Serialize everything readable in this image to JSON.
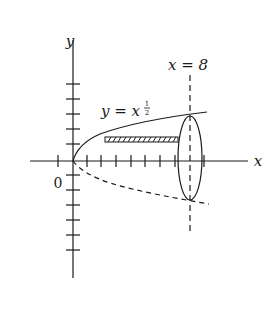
{
  "figure": {
    "type": "solid-of-revolution diagram",
    "axes": {
      "x_label": "x",
      "y_label": "y",
      "origin_label": "0"
    },
    "curve": {
      "label_lhs": "y = x",
      "label_exponent_num": "1",
      "label_exponent_den": "2",
      "equation": "y = x^(1/2)"
    },
    "boundary_line": {
      "label": "x = 8"
    },
    "elements": [
      "upper curve y = x^(1/2) (solid)",
      "mirrored curve y = -x^(1/2) (dashed)",
      "vertical dashed line at x = 8",
      "elliptical cross-section at x = 8",
      "hatched horizontal strip (shell element)"
    ],
    "colors": {
      "ink": "#1a1a1a",
      "background": "#ffffff"
    }
  }
}
